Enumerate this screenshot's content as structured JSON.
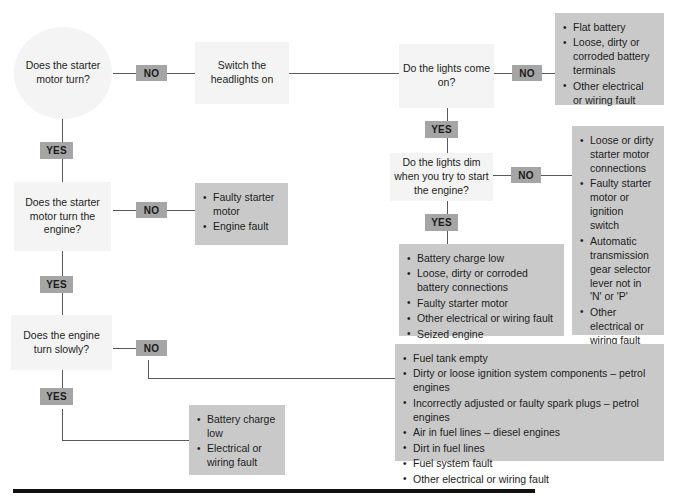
{
  "diagram": {
    "colors": {
      "question_fill": "#f4f4f4",
      "answer_fill": "#c9c9c9",
      "label_fill": "#a5a5a5",
      "line": "#595959",
      "rule": "#111111",
      "text": "#1d1d1d"
    },
    "nodes": {
      "q_starter_turn": {
        "text": "Does the starter motor turn?",
        "shape": "circle",
        "kind": "question"
      },
      "a_switch_headlights": {
        "text": "Switch the headlights on",
        "shape": "rect",
        "kind": "question"
      },
      "q_lights_come_on": {
        "text": "Do the lights come on?",
        "shape": "rect",
        "kind": "question"
      },
      "q_lights_dim": {
        "text": "Do the lights dim when you try to start the engine?",
        "shape": "rect",
        "kind": "question"
      },
      "q_starter_turn_engine": {
        "text": "Does the starter motor turn the engine?",
        "shape": "rect",
        "kind": "question"
      },
      "q_engine_turn_slowly": {
        "text": "Does the engine turn slowly?",
        "shape": "rect",
        "kind": "question"
      }
    },
    "answer_lists": {
      "lights_no": [
        "Flat battery",
        "Loose, dirty or corroded battery terminals",
        "Other electrical or wiring fault"
      ],
      "dim_no": [
        "Loose or dirty starter motor connections",
        "Faulty starter motor or ignition switch",
        "Automatic transmission gear selector lever not in 'N' or 'P'",
        "Other electrical or wiring fault"
      ],
      "dim_yes": [
        "Battery charge low",
        "Loose, dirty or corroded battery connections",
        "Faulty starter motor",
        "Other electrical or wiring fault",
        "Seized engine"
      ],
      "starter_engine_no": [
        "Faulty starter motor",
        "Engine fault"
      ],
      "slowly_yes": [
        "Battery charge low",
        "Electrical or wiring fault"
      ],
      "slowly_no": [
        "Fuel tank empty",
        "Dirty or loose ignition system components – petrol engines",
        "Incorrectly adjusted or faulty spark plugs – petrol engines",
        "Air in fuel lines –  diesel engines",
        "Dirt in fuel lines",
        "Fuel system fault",
        "Other electrical or wiring fault"
      ]
    },
    "edge_labels": {
      "no_starter_turn": "NO",
      "yes_starter_turn": "YES",
      "no_lights_come_on": "NO",
      "yes_lights_come_on": "YES",
      "no_lights_dim": "NO",
      "yes_lights_dim": "YES",
      "no_starter_engine": "NO",
      "yes_starter_engine": "YES",
      "no_engine_slowly": "NO",
      "yes_engine_slowly": "YES"
    }
  }
}
